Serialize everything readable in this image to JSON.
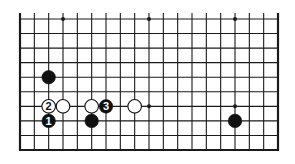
{
  "diagram": {
    "type": "go-board-partial",
    "board_size": 19,
    "visible_rows": 10,
    "open_edge": "top",
    "colors": {
      "background": "#ffffff",
      "line": "#1a1a1a",
      "black_stone": "#111111",
      "white_stone": "#ffffff",
      "label_on_black": "#ffffff",
      "label_on_white": "#111111"
    },
    "star_points": [
      {
        "col": 3,
        "row": 0
      },
      {
        "col": 9,
        "row": 0
      },
      {
        "col": 15,
        "row": 0
      },
      {
        "col": 3,
        "row": 6
      },
      {
        "col": 9,
        "row": 6
      },
      {
        "col": 15,
        "row": 6
      }
    ],
    "stones": [
      {
        "color": "black",
        "col": 2,
        "row": 4,
        "label": ""
      },
      {
        "color": "white",
        "col": 2,
        "row": 6,
        "label": "2"
      },
      {
        "color": "white",
        "col": 3,
        "row": 6,
        "label": ""
      },
      {
        "color": "white",
        "col": 5,
        "row": 6,
        "label": ""
      },
      {
        "color": "black",
        "col": 6,
        "row": 6,
        "label": "3"
      },
      {
        "color": "white",
        "col": 8,
        "row": 6,
        "label": ""
      },
      {
        "color": "black",
        "col": 2,
        "row": 7,
        "label": "1"
      },
      {
        "color": "black",
        "col": 5,
        "row": 7,
        "label": ""
      },
      {
        "color": "black",
        "col": 15,
        "row": 7,
        "label": ""
      }
    ]
  }
}
